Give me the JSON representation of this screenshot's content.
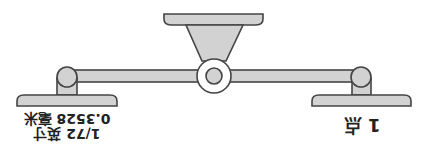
{
  "diagram": {
    "type": "balance-scale",
    "orientation": "rotated-180",
    "colors": {
      "fill": "#d2d2d2",
      "stroke": "#444444",
      "background": "#ffffff",
      "text": "#222222"
    },
    "left_pan": {
      "line1": "1/72 英寸",
      "line2": "0.3528 毫米"
    },
    "right_pan": {
      "label": "1 点"
    }
  }
}
